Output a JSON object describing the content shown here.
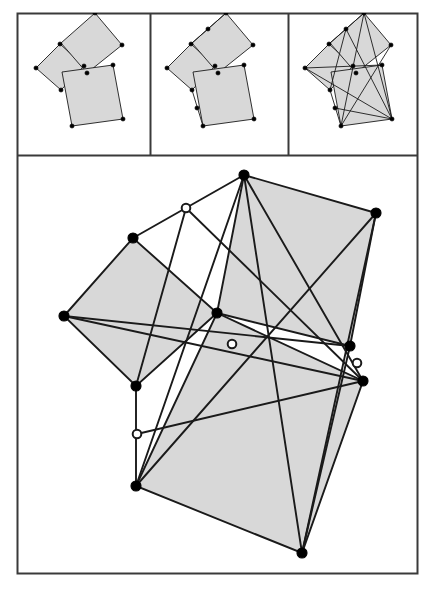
{
  "figure": {
    "background_color": "#ffffff",
    "stroke_color": "#1a1a1a",
    "square_fill": "#d8d8d8",
    "frame_color": "#3a3a3a",
    "vertex_fill_color": "#000000",
    "vertex_hollow_fill": "#ffffff",
    "panel_count": 4,
    "caption": ""
  },
  "frame": {
    "outer": {
      "x": 17,
      "y": 13,
      "w": 400,
      "h": 560
    },
    "top_row_bottom_y": 155,
    "divider_x_1": 150,
    "divider_x_2": 288
  },
  "panels": [
    {
      "id": "panel-1",
      "name": "step-1-three-squares",
      "label": "",
      "box": {
        "x": 17,
        "y": 13,
        "w": 133,
        "h": 142
      },
      "description": "Three squares erected on a triangle, no construction lines",
      "squares": [
        {
          "name": "square-left",
          "points": [
            [
              36,
              68
            ],
            [
              60,
              44
            ],
            [
              84,
              66
            ],
            [
              61,
              90
            ]
          ]
        },
        {
          "name": "square-upper",
          "points": [
            [
              61,
              43
            ],
            [
              95,
              13
            ],
            [
              122,
              45
            ],
            [
              87,
              73
            ]
          ]
        },
        {
          "name": "square-lower",
          "points": [
            [
              62,
              72
            ],
            [
              113,
              65
            ],
            [
              123,
              119
            ],
            [
              72,
              126
            ]
          ]
        }
      ],
      "vertices": [
        {
          "x": 36,
          "y": 68,
          "filled": true
        },
        {
          "x": 60,
          "y": 44,
          "filled": true
        },
        {
          "x": 84,
          "y": 66,
          "filled": true
        },
        {
          "x": 61,
          "y": 90,
          "filled": true
        },
        {
          "x": 95,
          "y": 13,
          "filled": true
        },
        {
          "x": 122,
          "y": 45,
          "filled": true
        },
        {
          "x": 87,
          "y": 73,
          "filled": true
        },
        {
          "x": 113,
          "y": 65,
          "filled": true
        },
        {
          "x": 123,
          "y": 119,
          "filled": true
        },
        {
          "x": 72,
          "y": 126,
          "filled": true
        }
      ],
      "lines": []
    },
    {
      "id": "panel-2",
      "name": "step-2-midpoint-links",
      "label": "",
      "box": {
        "x": 150,
        "y": 13,
        "w": 138,
        "h": 142
      },
      "description": "Same three squares plus two connector segments with midpoint markers",
      "squares": [
        {
          "name": "square-left",
          "points": [
            [
              167,
              68
            ],
            [
              191,
              44
            ],
            [
              215,
              66
            ],
            [
              192,
              90
            ]
          ]
        },
        {
          "name": "square-upper",
          "points": [
            [
              192,
              43
            ],
            [
              226,
              13
            ],
            [
              253,
              45
            ],
            [
              218,
              73
            ]
          ]
        },
        {
          "name": "square-lower",
          "points": [
            [
              193,
              72
            ],
            [
              244,
              65
            ],
            [
              254,
              119
            ],
            [
              203,
              126
            ]
          ]
        }
      ],
      "lines": [
        {
          "name": "connector-upper",
          "from": [
            191,
            44
          ],
          "to": [
            226,
            13
          ]
        },
        {
          "name": "connector-lower",
          "from": [
            192,
            90
          ],
          "to": [
            203,
            126
          ]
        }
      ],
      "vertices": [
        {
          "x": 167,
          "y": 68,
          "filled": true
        },
        {
          "x": 191,
          "y": 44,
          "filled": true
        },
        {
          "x": 215,
          "y": 66,
          "filled": true
        },
        {
          "x": 192,
          "y": 90,
          "filled": true
        },
        {
          "x": 226,
          "y": 13,
          "filled": true
        },
        {
          "x": 253,
          "y": 45,
          "filled": true
        },
        {
          "x": 218,
          "y": 73,
          "filled": true
        },
        {
          "x": 244,
          "y": 65,
          "filled": true
        },
        {
          "x": 254,
          "y": 119,
          "filled": true
        },
        {
          "x": 203,
          "y": 126,
          "filled": true
        },
        {
          "x": 208,
          "y": 29,
          "filled": true
        },
        {
          "x": 197,
          "y": 108,
          "filled": true
        }
      ]
    },
    {
      "id": "panel-3",
      "name": "step-3-cevians-concurrent",
      "label": "",
      "box": {
        "x": 288,
        "y": 13,
        "w": 129,
        "h": 142
      },
      "description": "Full construction with all cevians drawn meeting at a common point",
      "squares": [
        {
          "name": "square-left",
          "points": [
            [
              305,
              68
            ],
            [
              329,
              44
            ],
            [
              353,
              66
            ],
            [
              330,
              90
            ]
          ]
        },
        {
          "name": "square-upper",
          "points": [
            [
              330,
              43
            ],
            [
              364,
              13
            ],
            [
              391,
              45
            ],
            [
              356,
              73
            ]
          ]
        },
        {
          "name": "square-lower",
          "points": [
            [
              331,
              72
            ],
            [
              382,
              65
            ],
            [
              392,
              119
            ],
            [
              341,
              126
            ]
          ]
        }
      ],
      "lines": [
        {
          "name": "connector-upper",
          "from": [
            329,
            44
          ],
          "to": [
            364,
            13
          ]
        },
        {
          "name": "connector-lower",
          "from": [
            330,
            90
          ],
          "to": [
            341,
            126
          ]
        },
        {
          "name": "cevian-a",
          "from": [
            364,
            13
          ],
          "to": [
            341,
            126
          ]
        },
        {
          "name": "cevian-b",
          "from": [
            305,
            68
          ],
          "to": [
            392,
            119
          ]
        },
        {
          "name": "cevian-c",
          "from": [
            391,
            45
          ],
          "to": [
            341,
            126
          ]
        },
        {
          "name": "cevian-d",
          "from": [
            346,
            29
          ],
          "to": [
            392,
            119
          ]
        },
        {
          "name": "cevian-e",
          "from": [
            305,
            68
          ],
          "to": [
            382,
            65
          ]
        },
        {
          "name": "cevian-f",
          "from": [
            364,
            13
          ],
          "to": [
            392,
            119
          ]
        },
        {
          "name": "cevian-g",
          "from": [
            346,
            29
          ],
          "to": [
            330,
            90
          ]
        },
        {
          "name": "cevian-h",
          "from": [
            335,
            108
          ],
          "to": [
            392,
            119
          ]
        }
      ],
      "vertices": [
        {
          "x": 305,
          "y": 68,
          "filled": true
        },
        {
          "x": 329,
          "y": 44,
          "filled": true
        },
        {
          "x": 353,
          "y": 66,
          "filled": true
        },
        {
          "x": 330,
          "y": 90,
          "filled": true
        },
        {
          "x": 364,
          "y": 13,
          "filled": true
        },
        {
          "x": 391,
          "y": 45,
          "filled": true
        },
        {
          "x": 356,
          "y": 73,
          "filled": true
        },
        {
          "x": 382,
          "y": 65,
          "filled": true
        },
        {
          "x": 392,
          "y": 119,
          "filled": true
        },
        {
          "x": 341,
          "y": 126,
          "filled": true
        },
        {
          "x": 346,
          "y": 29,
          "filled": true
        },
        {
          "x": 335,
          "y": 108,
          "filled": true
        }
      ]
    },
    {
      "id": "panel-4",
      "name": "main-enlarged-construction",
      "label": "",
      "box": {
        "x": 17,
        "y": 155,
        "w": 400,
        "h": 418
      },
      "description": "Enlarged view of the complete construction",
      "squares": [
        {
          "name": "square-left",
          "points": [
            [
              64,
              316
            ],
            [
              133,
              238
            ],
            [
              217,
              313
            ],
            [
              136,
              386
            ]
          ]
        },
        {
          "name": "square-upper",
          "points": [
            [
              217,
              313
            ],
            [
              244,
              175
            ],
            [
              376,
              213
            ],
            [
              350,
              346
            ]
          ]
        },
        {
          "name": "square-lower",
          "points": [
            [
              217,
              313
            ],
            [
              363,
              381
            ],
            [
              302,
              553
            ],
            [
              136,
              486
            ]
          ]
        }
      ],
      "lines": [
        {
          "name": "connector-upper",
          "from": [
            133,
            238
          ],
          "to": [
            244,
            175
          ]
        },
        {
          "name": "connector-lower",
          "from": [
            136,
            386
          ],
          "to": [
            136,
            486
          ]
        },
        {
          "name": "cevian-apex-to-bottomleft",
          "from": [
            244,
            175
          ],
          "to": [
            136,
            486
          ]
        },
        {
          "name": "cevian-left-to-bottomright",
          "from": [
            64,
            316
          ],
          "to": [
            363,
            381
          ]
        },
        {
          "name": "cevian-topright-to-bottomleft",
          "from": [
            376,
            213
          ],
          "to": [
            136,
            486
          ]
        },
        {
          "name": "cevian-midupper-to-bottomright",
          "from": [
            186,
            208
          ],
          "to": [
            363,
            381
          ]
        },
        {
          "name": "cevian-left-to-rightmid",
          "from": [
            64,
            316
          ],
          "to": [
            350,
            346
          ]
        },
        {
          "name": "cevian-apex-to-bottomright",
          "from": [
            244,
            175
          ],
          "to": [
            363,
            381
          ]
        },
        {
          "name": "cevian-midupper-to-leftbottom",
          "from": [
            186,
            208
          ],
          "to": [
            136,
            386
          ]
        },
        {
          "name": "cevian-midlower-to-rightmid",
          "from": [
            137,
            434
          ],
          "to": [
            363,
            381
          ]
        },
        {
          "name": "cevian-topright-to-bottom",
          "from": [
            376,
            213
          ],
          "to": [
            302,
            553
          ]
        },
        {
          "name": "cevian-rightmid-to-bottom",
          "from": [
            350,
            346
          ],
          "to": [
            302,
            553
          ]
        },
        {
          "name": "cevian-apex-to-bottom",
          "from": [
            244,
            175
          ],
          "to": [
            302,
            553
          ]
        }
      ],
      "vertices": [
        {
          "name": "vertex-left",
          "x": 64,
          "y": 316,
          "filled": true
        },
        {
          "name": "vertex-upper-left",
          "x": 133,
          "y": 238,
          "filled": true
        },
        {
          "name": "vertex-center",
          "x": 217,
          "y": 313,
          "filled": true
        },
        {
          "name": "vertex-lower-left",
          "x": 136,
          "y": 386,
          "filled": true
        },
        {
          "name": "vertex-apex",
          "x": 244,
          "y": 175,
          "filled": true
        },
        {
          "name": "vertex-top-right",
          "x": 376,
          "y": 213,
          "filled": true
        },
        {
          "name": "vertex-right-mid",
          "x": 350,
          "y": 346,
          "filled": true
        },
        {
          "name": "vertex-right-lower",
          "x": 363,
          "y": 381,
          "filled": true
        },
        {
          "name": "vertex-bottom",
          "x": 302,
          "y": 553,
          "filled": true
        },
        {
          "name": "vertex-bottom-left",
          "x": 136,
          "y": 486,
          "filled": true
        },
        {
          "name": "vertex-mid-upper-connector",
          "x": 186,
          "y": 208,
          "filled": false
        },
        {
          "name": "vertex-mid-lower-connector",
          "x": 137,
          "y": 434,
          "filled": false
        },
        {
          "name": "vertex-concurrency",
          "x": 232,
          "y": 344,
          "filled": false
        },
        {
          "name": "vertex-mid-right",
          "x": 357,
          "y": 363,
          "filled": false
        }
      ]
    }
  ]
}
